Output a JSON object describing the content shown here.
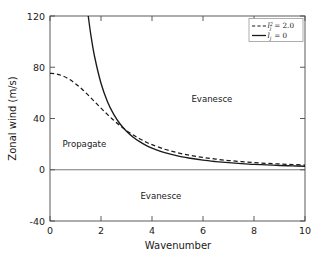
{
  "chart_data": {
    "type": "line",
    "title": "",
    "xlabel": "Wavenumber",
    "ylabel": "Zonal wind (m/s)",
    "xlim": [
      0,
      10
    ],
    "ylim": [
      -40,
      120
    ],
    "xticks": [
      "0",
      "2",
      "4",
      "6",
      "8",
      "10"
    ],
    "xtick_values": [
      0,
      2,
      4,
      6,
      8,
      10
    ],
    "yticks": [
      "-40",
      "0",
      "40",
      "80",
      "120"
    ],
    "ytick_values": [
      -40,
      0,
      40,
      80,
      120
    ],
    "grid": false,
    "legend_position": "upper right",
    "series": [
      {
        "name": "lj2_eq_2p0",
        "label": "l_j^2 = 2.0",
        "style": "dashed",
        "color": "#1a1a1a",
        "x": [
          0.0,
          0.25,
          0.5,
          0.75,
          1.0,
          1.25,
          1.5,
          1.75,
          2.0,
          2.25,
          2.5,
          2.75,
          3.0,
          3.25,
          3.5,
          3.75,
          4.0,
          4.5,
          5.0,
          5.5,
          6.0,
          6.5,
          7.0,
          7.5,
          8.0,
          8.5,
          9.0,
          9.5,
          10.0
        ],
        "y": [
          75.3,
          74.8,
          73.2,
          70.7,
          67.2,
          63.0,
          58.2,
          53.2,
          48.1,
          43.2,
          38.6,
          34.4,
          30.6,
          27.3,
          24.4,
          21.8,
          19.6,
          16.0,
          13.3,
          11.2,
          9.6,
          8.3,
          7.2,
          6.4,
          5.6,
          5.0,
          4.5,
          4.1,
          3.7
        ]
      },
      {
        "name": "lj_eq_0",
        "label": "l_j = 0",
        "style": "solid",
        "color": "#1a1a1a",
        "x": [
          1.45,
          1.5,
          1.6,
          1.75,
          2.0,
          2.25,
          2.5,
          2.75,
          3.0,
          3.25,
          3.5,
          3.75,
          4.0,
          4.5,
          5.0,
          5.5,
          6.0,
          6.5,
          7.0,
          7.5,
          8.0,
          8.5,
          9.0,
          9.5,
          10.0
        ],
        "y": [
          128.0,
          120.0,
          105.5,
          88.2,
          67.5,
          53.3,
          43.2,
          35.7,
          30.0,
          25.6,
          22.1,
          19.2,
          16.9,
          13.3,
          10.8,
          9.0,
          7.5,
          6.4,
          5.5,
          4.8,
          4.2,
          3.8,
          3.3,
          3.0,
          2.7
        ]
      }
    ],
    "reference_lines": [
      {
        "name": "zero-line",
        "orientation": "horizontal",
        "value": 0,
        "color": "#555555"
      }
    ],
    "annotations": [
      {
        "name": "propagate",
        "text": "Propagate",
        "x": 1.35,
        "y": 18.0
      },
      {
        "name": "evanesce-upper",
        "text": "Evanesce",
        "x": 6.35,
        "y": 53.0
      },
      {
        "name": "evanesce-lower",
        "text": "Evanesce",
        "x": 4.35,
        "y": -22.5
      }
    ]
  },
  "legend": {
    "entries": [
      {
        "symbol": "l",
        "sub": "j",
        "sup": "2",
        "equals": " = 2.0",
        "style": "dashed"
      },
      {
        "symbol": "l",
        "sub": "j",
        "sup": "",
        "equals": " = 0",
        "style": "solid"
      }
    ]
  },
  "axes": {
    "xlabel": "Wavenumber",
    "ylabel": "Zonal wind (m/s)",
    "xticks": [
      "0",
      "2",
      "4",
      "6",
      "8",
      "10"
    ],
    "yticks": [
      "120",
      "80",
      "40",
      "0",
      "-40"
    ]
  },
  "annotations": {
    "propagate": "Propagate",
    "evanesce_upper": "Evanesce",
    "evanesce_lower": "Evanesce"
  }
}
